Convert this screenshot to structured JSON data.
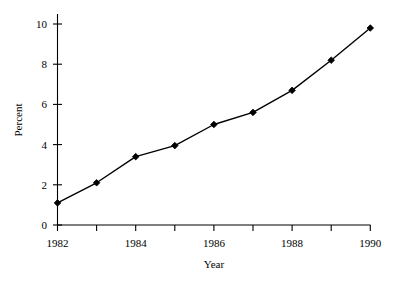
{
  "chart_data": {
    "type": "line",
    "title": "",
    "subtitle": "",
    "xlabel": "Year",
    "ylabel": "Percent",
    "x": [
      1982,
      1983,
      1984,
      1985,
      1986,
      1987,
      1988,
      1989,
      1990
    ],
    "values": [
      1.1,
      2.1,
      3.4,
      3.95,
      5.0,
      5.6,
      6.7,
      8.2,
      9.8
    ],
    "series": [
      {
        "name": "Percent",
        "values": [
          1.1,
          2.1,
          3.4,
          3.95,
          5.0,
          5.6,
          6.7,
          8.2,
          9.8
        ]
      }
    ],
    "xlim": [
      1982,
      1990
    ],
    "ylim": [
      0,
      10
    ],
    "x_ticks": [
      1982,
      1983,
      1984,
      1985,
      1986,
      1987,
      1988,
      1989,
      1990
    ],
    "x_tick_labels": [
      "1982",
      "",
      "1984",
      "",
      "1986",
      "",
      "1988",
      "",
      "1990"
    ],
    "y_ticks": [
      0,
      2,
      4,
      6,
      8,
      10
    ],
    "y_tick_labels": [
      "0",
      "2",
      "4",
      "6",
      "8",
      "10"
    ],
    "grid": false,
    "legend": false,
    "legend_position": "none",
    "marker": "diamond",
    "line_color": "#000000",
    "marker_color": "#000000",
    "background_color": "#ffffff"
  },
  "axes": {
    "x_axis_label": "Year",
    "y_axis_label": "Percent",
    "x_tick_text": {
      "t0": "1982",
      "t2": "1984",
      "t4": "1986",
      "t6": "1988",
      "t8": "1990"
    },
    "y_tick_text": {
      "t0": "0",
      "t1": "2",
      "t2": "4",
      "t3": "6",
      "t4": "8",
      "t5": "10"
    }
  }
}
